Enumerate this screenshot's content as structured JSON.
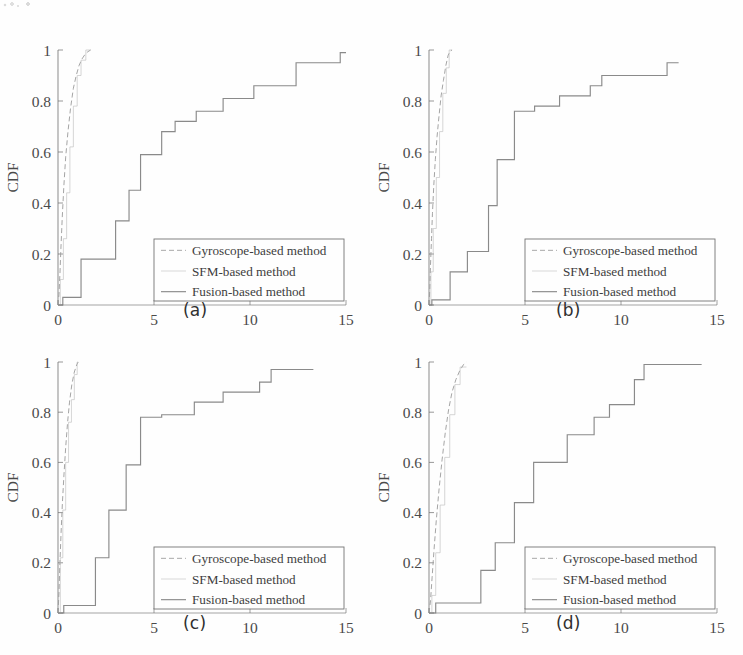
{
  "figure": {
    "background_color": "#fefefe",
    "ink_color": "#6e6e6e",
    "text_color": "#3a3a3a",
    "panel_count": 4
  },
  "legend": {
    "entries": [
      {
        "label": "Gyroscope-based method",
        "name": "gyroscope-based-method",
        "color": "#9a9a9a",
        "dash": "5,3"
      },
      {
        "label": "SFM-based method",
        "name": "sfm-based-method",
        "color": "#b4b4b4",
        "dash": "none"
      },
      {
        "label": "Fusion-based method",
        "name": "fusion-based-method",
        "color": "#7d7d7d",
        "dash": "none"
      }
    ]
  },
  "axes": {
    "ylabel": "CDF",
    "xticks": [
      "0",
      "5",
      "10",
      "15"
    ],
    "xtick_values": [
      0,
      5,
      10,
      15
    ],
    "yticks": [
      "0",
      "0.2",
      "0.4",
      "0.6",
      "0.8",
      "1"
    ],
    "ytick_values": [
      0,
      0.2,
      0.4,
      0.6,
      0.8,
      1
    ],
    "xlim": [
      0,
      15
    ],
    "ylim": [
      0,
      1
    ],
    "grid": false
  },
  "panels": [
    {
      "id": "a",
      "caption": "(a)"
    },
    {
      "id": "b",
      "caption": "(b)"
    },
    {
      "id": "c",
      "caption": "(c)"
    },
    {
      "id": "d",
      "caption": "(d)"
    }
  ],
  "chart_data": [
    {
      "type": "line",
      "panel": "(a)",
      "title": "",
      "xlabel": "",
      "ylabel": "CDF",
      "xlim": [
        0,
        15
      ],
      "ylim": [
        0,
        1
      ],
      "grid": false,
      "legend_position": "lower right",
      "series": [
        {
          "name": "Gyroscope-based method",
          "style": "smooth-steep",
          "x": [
            0.0,
            0.05,
            0.1,
            0.15,
            0.22,
            0.3,
            0.4,
            0.52,
            0.65,
            0.8,
            0.95,
            1.1,
            1.25,
            1.4,
            1.55,
            1.7
          ],
          "y": [
            0.0,
            0.04,
            0.12,
            0.22,
            0.34,
            0.46,
            0.58,
            0.68,
            0.77,
            0.85,
            0.9,
            0.94,
            0.965,
            0.982,
            0.993,
            1.0
          ]
        },
        {
          "name": "SFM-based method",
          "style": "step",
          "x": [
            0.0,
            0.12,
            0.12,
            0.28,
            0.28,
            0.45,
            0.45,
            0.62,
            0.62,
            0.8,
            0.8,
            1.0,
            1.0,
            1.2,
            1.2,
            1.45,
            1.45,
            1.7
          ],
          "y": [
            0.0,
            0.0,
            0.1,
            0.1,
            0.26,
            0.26,
            0.44,
            0.44,
            0.62,
            0.62,
            0.78,
            0.78,
            0.9,
            0.9,
            0.96,
            0.96,
            1.0,
            1.0
          ]
        },
        {
          "name": "Fusion-based method",
          "style": "step",
          "x": [
            0.0,
            0.25,
            0.25,
            1.2,
            1.2,
            3.0,
            3.0,
            3.7,
            3.7,
            4.3,
            4.3,
            5.4,
            5.4,
            6.1,
            6.1,
            7.2,
            7.2,
            8.6,
            8.6,
            10.2,
            10.2,
            12.4,
            12.4,
            14.7,
            14.7,
            15.0
          ],
          "y": [
            0.0,
            0.0,
            0.03,
            0.03,
            0.18,
            0.18,
            0.33,
            0.33,
            0.45,
            0.45,
            0.59,
            0.59,
            0.68,
            0.68,
            0.72,
            0.72,
            0.76,
            0.76,
            0.81,
            0.81,
            0.86,
            0.86,
            0.95,
            0.95,
            0.99,
            0.99
          ]
        }
      ]
    },
    {
      "type": "line",
      "panel": "(b)",
      "title": "",
      "xlabel": "",
      "ylabel": "CDF",
      "xlim": [
        0,
        15
      ],
      "ylim": [
        0,
        1
      ],
      "grid": false,
      "legend_position": "lower right",
      "series": [
        {
          "name": "Gyroscope-based method",
          "style": "smooth-steep",
          "x": [
            0.0,
            0.04,
            0.08,
            0.13,
            0.18,
            0.25,
            0.33,
            0.42,
            0.52,
            0.63,
            0.75,
            0.88,
            1.0,
            1.1,
            1.2
          ],
          "y": [
            0.0,
            0.06,
            0.16,
            0.26,
            0.36,
            0.47,
            0.57,
            0.66,
            0.74,
            0.82,
            0.88,
            0.94,
            0.98,
            0.995,
            1.0
          ]
        },
        {
          "name": "SFM-based method",
          "style": "step",
          "x": [
            0.0,
            0.1,
            0.1,
            0.22,
            0.22,
            0.38,
            0.38,
            0.55,
            0.55,
            0.72,
            0.72,
            0.9,
            0.9,
            1.05,
            1.05,
            1.2
          ],
          "y": [
            0.0,
            0.0,
            0.13,
            0.13,
            0.3,
            0.3,
            0.5,
            0.5,
            0.68,
            0.68,
            0.83,
            0.83,
            0.93,
            0.93,
            1.0,
            1.0
          ]
        },
        {
          "name": "Fusion-based method",
          "style": "step",
          "x": [
            0.0,
            0.15,
            0.15,
            1.05,
            1.05,
            1.1,
            1.1,
            2.0,
            2.0,
            3.0,
            3.0,
            3.1,
            3.1,
            3.55,
            3.55,
            4.45,
            4.45,
            5.5,
            5.5,
            6.8,
            6.8,
            8.4,
            8.4,
            9.0,
            9.0,
            12.4,
            12.4,
            13.0
          ],
          "y": [
            0.0,
            0.0,
            0.02,
            0.02,
            0.02,
            0.02,
            0.13,
            0.13,
            0.21,
            0.21,
            0.21,
            0.21,
            0.39,
            0.39,
            0.57,
            0.57,
            0.76,
            0.76,
            0.78,
            0.78,
            0.82,
            0.82,
            0.86,
            0.86,
            0.9,
            0.9,
            0.95,
            0.95
          ]
        }
      ]
    },
    {
      "type": "line",
      "panel": "(c)",
      "title": "",
      "xlabel": "",
      "ylabel": "CDF",
      "xlim": [
        0,
        15
      ],
      "ylim": [
        0,
        1
      ],
      "grid": false,
      "legend_position": "lower right",
      "series": [
        {
          "name": "Gyroscope-based method",
          "style": "smooth-steep",
          "x": [
            0.0,
            0.05,
            0.1,
            0.16,
            0.23,
            0.31,
            0.4,
            0.5,
            0.6,
            0.72,
            0.85,
            0.98,
            1.05
          ],
          "y": [
            0.0,
            0.08,
            0.2,
            0.32,
            0.44,
            0.55,
            0.66,
            0.76,
            0.84,
            0.91,
            0.96,
            0.99,
            1.0
          ]
        },
        {
          "name": "SFM-based method",
          "style": "step",
          "x": [
            0.0,
            0.12,
            0.12,
            0.25,
            0.25,
            0.4,
            0.4,
            0.55,
            0.55,
            0.7,
            0.7,
            0.85,
            0.85,
            1.0,
            1.0,
            1.05
          ],
          "y": [
            0.0,
            0.0,
            0.22,
            0.22,
            0.41,
            0.41,
            0.6,
            0.6,
            0.76,
            0.76,
            0.85,
            0.85,
            0.95,
            0.95,
            1.0,
            1.0
          ]
        },
        {
          "name": "Fusion-based method",
          "style": "step",
          "x": [
            0.0,
            0.3,
            0.3,
            1.95,
            1.95,
            2.65,
            2.65,
            3.55,
            3.55,
            4.3,
            4.3,
            5.4,
            5.4,
            7.1,
            7.1,
            8.6,
            8.6,
            10.5,
            10.5,
            11.1,
            11.1,
            13.3
          ],
          "y": [
            0.0,
            0.0,
            0.03,
            0.03,
            0.22,
            0.22,
            0.41,
            0.41,
            0.59,
            0.59,
            0.78,
            0.78,
            0.79,
            0.79,
            0.84,
            0.84,
            0.88,
            0.88,
            0.92,
            0.92,
            0.97,
            0.97
          ]
        }
      ]
    },
    {
      "type": "line",
      "panel": "(d)",
      "title": "",
      "xlabel": "",
      "ylabel": "CDF",
      "xlim": [
        0,
        15
      ],
      "ylim": [
        0,
        1
      ],
      "grid": false,
      "legend_position": "lower right",
      "series": [
        {
          "name": "Gyroscope-based method",
          "style": "smooth-steep",
          "x": [
            0.0,
            0.08,
            0.16,
            0.26,
            0.38,
            0.52,
            0.68,
            0.85,
            1.02,
            1.2,
            1.4,
            1.6,
            1.8,
            1.95
          ],
          "y": [
            0.0,
            0.05,
            0.14,
            0.25,
            0.37,
            0.49,
            0.61,
            0.72,
            0.81,
            0.88,
            0.93,
            0.965,
            0.99,
            1.0
          ]
        },
        {
          "name": "SFM-based method",
          "style": "step",
          "x": [
            0.0,
            0.15,
            0.15,
            0.35,
            0.35,
            0.58,
            0.58,
            0.82,
            0.82,
            1.08,
            1.08,
            1.35,
            1.35,
            1.62,
            1.62,
            1.95
          ],
          "y": [
            0.0,
            0.0,
            0.07,
            0.07,
            0.24,
            0.24,
            0.43,
            0.43,
            0.62,
            0.62,
            0.79,
            0.79,
            0.91,
            0.91,
            0.98,
            0.98
          ]
        },
        {
          "name": "Fusion-based method",
          "style": "step",
          "x": [
            0.0,
            0.35,
            0.35,
            2.0,
            2.0,
            2.7,
            2.7,
            3.45,
            3.45,
            4.45,
            4.45,
            5.45,
            5.45,
            7.2,
            7.2,
            8.6,
            8.6,
            9.4,
            9.4,
            10.7,
            10.7,
            11.2,
            11.2,
            14.2
          ],
          "y": [
            0.0,
            0.0,
            0.04,
            0.04,
            0.04,
            0.04,
            0.17,
            0.17,
            0.28,
            0.28,
            0.44,
            0.44,
            0.6,
            0.6,
            0.71,
            0.71,
            0.78,
            0.78,
            0.83,
            0.83,
            0.93,
            0.93,
            0.99,
            0.99
          ]
        }
      ]
    }
  ]
}
